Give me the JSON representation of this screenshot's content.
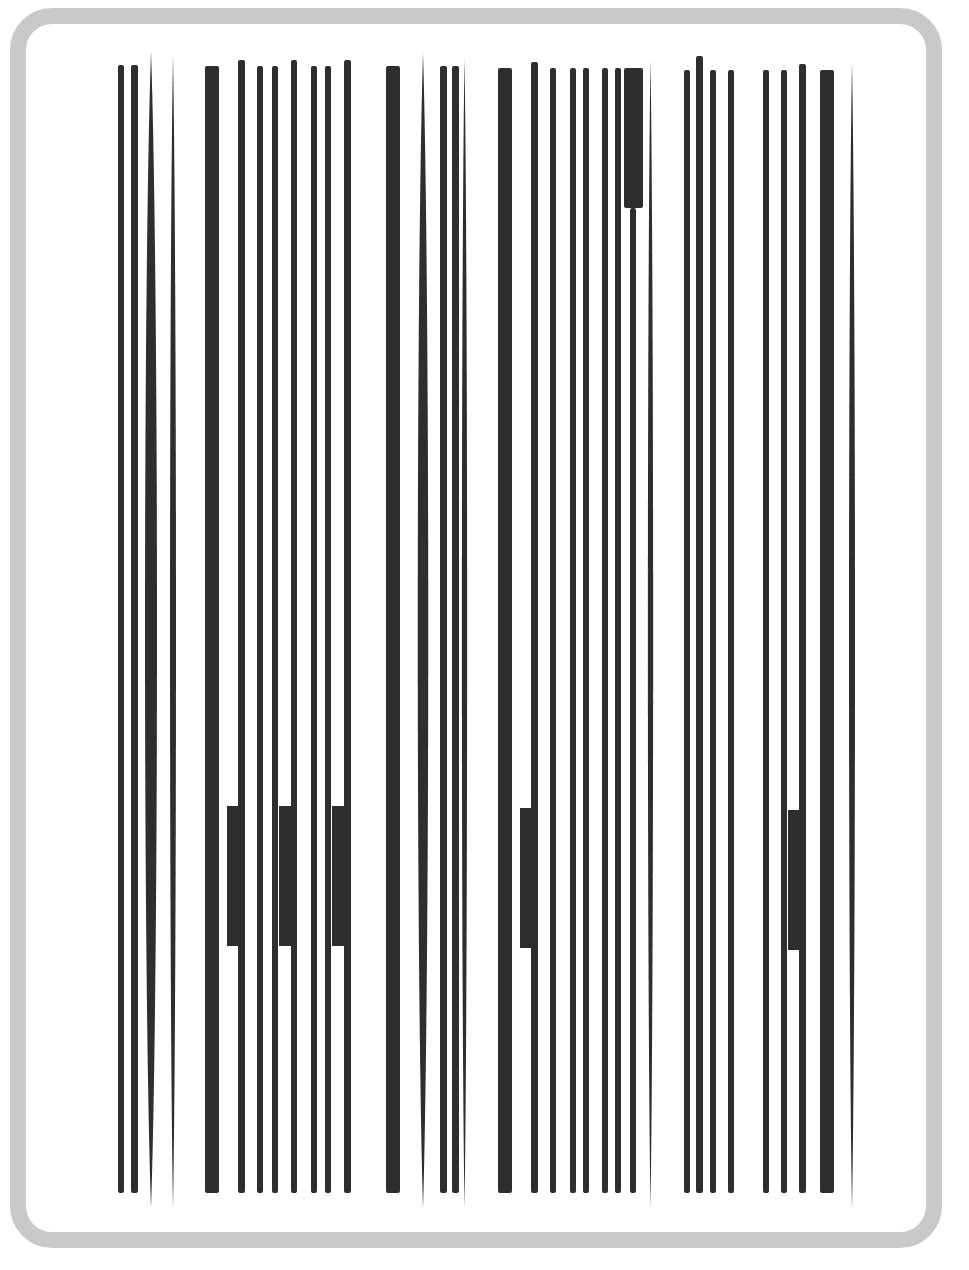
{
  "graphic": {
    "kind": "distorted-barcode",
    "frame_color": "#c9c9c9",
    "bar_color": "#2e2e2e",
    "background": "#ffffff"
  },
  "bars": [
    {
      "x": 118,
      "w": 6,
      "top": 65,
      "bottom": 1193,
      "shape": "rect"
    },
    {
      "x": 131,
      "w": 7,
      "top": 65,
      "bottom": 1193,
      "shape": "rect"
    },
    {
      "x": 144,
      "w": 14,
      "top": 52,
      "bottom": 1208,
      "shape": "lens"
    },
    {
      "x": 170,
      "w": 6,
      "top": 56,
      "bottom": 1208,
      "shape": "lens"
    },
    {
      "x": 205,
      "w": 14,
      "top": 66,
      "bottom": 1193,
      "shape": "rect"
    },
    {
      "x": 238,
      "w": 7,
      "top": 60,
      "bottom": 1193,
      "shape": "rect"
    },
    {
      "x": 257,
      "w": 6,
      "top": 66,
      "bottom": 1193,
      "shape": "rect"
    },
    {
      "x": 272,
      "w": 6,
      "top": 66,
      "bottom": 1193,
      "shape": "rect"
    },
    {
      "x": 291,
      "w": 6,
      "top": 60,
      "bottom": 1193,
      "shape": "rect"
    },
    {
      "x": 311,
      "w": 6,
      "top": 66,
      "bottom": 1193,
      "shape": "rect"
    },
    {
      "x": 325,
      "w": 6,
      "top": 66,
      "bottom": 1193,
      "shape": "rect"
    },
    {
      "x": 344,
      "w": 7,
      "top": 60,
      "bottom": 1193,
      "shape": "rect"
    },
    {
      "x": 386,
      "w": 14,
      "top": 66,
      "bottom": 1193,
      "shape": "rect"
    },
    {
      "x": 417,
      "w": 12,
      "top": 53,
      "bottom": 1208,
      "shape": "lens"
    },
    {
      "x": 440,
      "w": 7,
      "top": 66,
      "bottom": 1193,
      "shape": "rect"
    },
    {
      "x": 452,
      "w": 7,
      "top": 66,
      "bottom": 1193,
      "shape": "rect"
    },
    {
      "x": 462,
      "w": 5,
      "top": 58,
      "bottom": 1208,
      "shape": "lens"
    },
    {
      "x": 498,
      "w": 14,
      "top": 68,
      "bottom": 1193,
      "shape": "rect"
    },
    {
      "x": 531,
      "w": 7,
      "top": 62,
      "bottom": 1193,
      "shape": "rect"
    },
    {
      "x": 550,
      "w": 6,
      "top": 68,
      "bottom": 1193,
      "shape": "rect"
    },
    {
      "x": 570,
      "w": 6,
      "top": 68,
      "bottom": 1193,
      "shape": "rect"
    },
    {
      "x": 583,
      "w": 6,
      "top": 68,
      "bottom": 1193,
      "shape": "rect"
    },
    {
      "x": 602,
      "w": 6,
      "top": 68,
      "bottom": 1193,
      "shape": "rect"
    },
    {
      "x": 615,
      "w": 6,
      "top": 68,
      "bottom": 1193,
      "shape": "rect"
    },
    {
      "x": 624,
      "w": 19,
      "top": 68,
      "bottom": 208,
      "shape": "rect"
    },
    {
      "x": 630,
      "w": 6,
      "top": 208,
      "bottom": 1193,
      "shape": "rect"
    },
    {
      "x": 648,
      "w": 5,
      "top": 60,
      "bottom": 1208,
      "shape": "lens"
    },
    {
      "x": 684,
      "w": 6,
      "top": 70,
      "bottom": 1193,
      "shape": "rect"
    },
    {
      "x": 696,
      "w": 7,
      "top": 56,
      "bottom": 1193,
      "shape": "rect"
    },
    {
      "x": 710,
      "w": 6,
      "top": 70,
      "bottom": 1193,
      "shape": "rect"
    },
    {
      "x": 728,
      "w": 6,
      "top": 70,
      "bottom": 1193,
      "shape": "rect"
    },
    {
      "x": 763,
      "w": 6,
      "top": 70,
      "bottom": 1193,
      "shape": "rect"
    },
    {
      "x": 781,
      "w": 6,
      "top": 70,
      "bottom": 1193,
      "shape": "rect"
    },
    {
      "x": 799,
      "w": 7,
      "top": 64,
      "bottom": 1193,
      "shape": "rect"
    },
    {
      "x": 820,
      "w": 14,
      "top": 70,
      "bottom": 1193,
      "shape": "rect"
    },
    {
      "x": 849,
      "w": 6,
      "top": 62,
      "bottom": 1210,
      "shape": "lens"
    }
  ],
  "blocks": [
    {
      "x": 227,
      "y": 806,
      "w": 17,
      "h": 140
    },
    {
      "x": 279,
      "y": 806,
      "w": 17,
      "h": 140
    },
    {
      "x": 332,
      "y": 806,
      "w": 17,
      "h": 140
    },
    {
      "x": 520,
      "y": 808,
      "w": 17,
      "h": 140
    },
    {
      "x": 788,
      "y": 810,
      "w": 17,
      "h": 140
    }
  ]
}
